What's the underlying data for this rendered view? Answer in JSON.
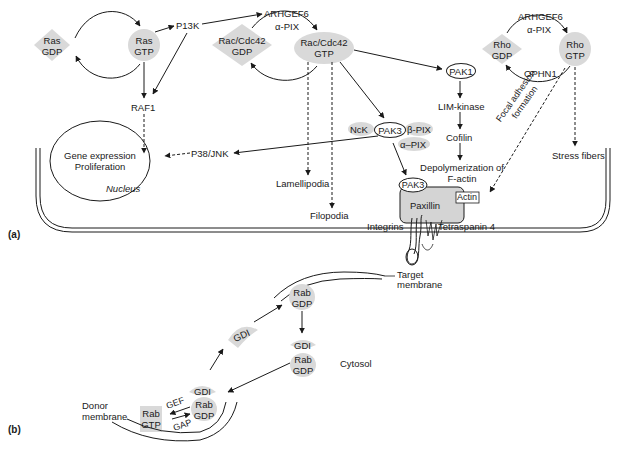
{
  "panels": {
    "a": {
      "label": "(a)",
      "ras": {
        "gdp": [
          "Ras",
          "GDP"
        ],
        "gtp": [
          "Ras",
          "GTP"
        ]
      },
      "p13k": "P13K",
      "raf1": "RAF1",
      "rac_gef": {
        "line1": "ARHGEF6",
        "line2": "α-PIX"
      },
      "rac": {
        "gdp": [
          "Rac/Cdc42",
          "GDP"
        ],
        "gtp": [
          "Rac/Cdc42",
          "GTP"
        ]
      },
      "rho_gef": {
        "line1": "ARHGEF6",
        "line2": "α-PIX"
      },
      "rho": {
        "gdp": [
          "Rho",
          "GDP"
        ],
        "gtp": [
          "Rho",
          "GTP"
        ]
      },
      "ophn1": "OPHN1",
      "pak1": "PAK1",
      "lim_kinase": "LIM-kinase",
      "cofilin": "Cofilin",
      "depolymerization": [
        "Depolymerization of",
        "F-actin"
      ],
      "nck": "NcK",
      "pak3_complex": "PAK3",
      "beta_pix": "β-PIX",
      "alpha_pix": "α–PIX",
      "p38_jnk": "P38/JNK",
      "nucleus": {
        "line1": "Gene expression",
        "line2": "Proliferation",
        "caption": "Nucleus"
      },
      "lamellipodia": "Lamellipodia",
      "filopodia": "Filopodia",
      "focal_adhesion": [
        "Focal adhesion",
        "formation"
      ],
      "stress_fibers": "Stress fibers",
      "pak3_membrane": "PAK3",
      "paxillin": "Paxillin",
      "actin": "Actin",
      "integrins": "Integrins",
      "tetraspanin": "Tetraspanin 4"
    },
    "b": {
      "label": "(b)",
      "target_membrane": [
        "Target",
        "membrane"
      ],
      "rab_gdp_target": [
        "Rab",
        "GDP"
      ],
      "gdi_mid": "GDI",
      "gdi_cytosol": "GDI",
      "rab_gdp_cytosol": [
        "Rab",
        "GDP"
      ],
      "cytosol": "Cytosol",
      "gdi_donor": "GDI",
      "donor_membrane": [
        "Donor",
        "membrane"
      ],
      "rab_gtp": [
        "Rab",
        "GTP"
      ],
      "rab_gdp_donor": [
        "Rab",
        "GDP"
      ],
      "gef": "GEF",
      "gap": "GAP"
    }
  },
  "colors": {
    "line": "#1a1a1a",
    "fill_gray": "#d9d9d9",
    "paxillin_fill": "#d4d4d4",
    "background": "#ffffff"
  }
}
